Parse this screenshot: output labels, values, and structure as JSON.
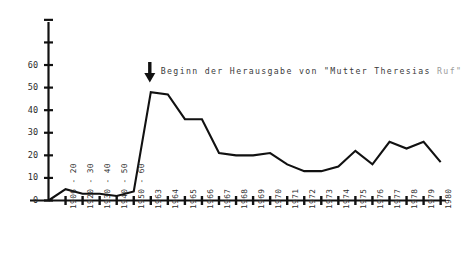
{
  "annotation": {
    "text": "Beginn der Herausgabe von \"Mutter Theresias Ruf\"",
    "arrow_icon": "down-arrow-icon",
    "arrow_points_to_category": "1963"
  },
  "axes": {
    "y_ticks": [
      "0",
      "10",
      "20",
      "30",
      "40",
      "50",
      "60"
    ],
    "y_extra_ticks_unlabeled": 2,
    "x_label": "",
    "y_label": ""
  },
  "chart_data": {
    "type": "line",
    "title": "",
    "subtitle": "",
    "xlabel": "",
    "ylabel": "",
    "ylim": [
      0,
      80
    ],
    "yticks": [
      0,
      10,
      20,
      30,
      40,
      50,
      60
    ],
    "grid": false,
    "legend": null,
    "annotations": [
      {
        "text": "Beginn der Herausgabe von \"Mutter Theresias Ruf\"",
        "at_category": "1963",
        "marker": "down-arrow"
      }
    ],
    "categories": [
      "1906 - 20",
      "1920 - 30",
      "1930 - 40",
      "1940 - 50",
      "1950 - 60",
      "1963",
      "1964",
      "1965",
      "1966",
      "1967",
      "1968",
      "1969",
      "1970",
      "1971",
      "1972",
      "1973",
      "1974",
      "1975",
      "1976",
      "1977",
      "1978",
      "1979",
      "1980"
    ],
    "values": [
      5,
      3,
      3,
      2,
      4,
      48,
      47,
      36,
      36,
      21,
      20,
      20,
      21,
      16,
      13,
      13,
      15,
      22,
      16,
      26,
      23,
      26,
      17
    ],
    "origin_value": 0,
    "series": [
      {
        "name": "Eintritte",
        "values": [
          5,
          3,
          3,
          2,
          4,
          48,
          47,
          36,
          36,
          21,
          20,
          20,
          21,
          16,
          13,
          13,
          15,
          22,
          16,
          26,
          23,
          26,
          17
        ]
      }
    ]
  }
}
